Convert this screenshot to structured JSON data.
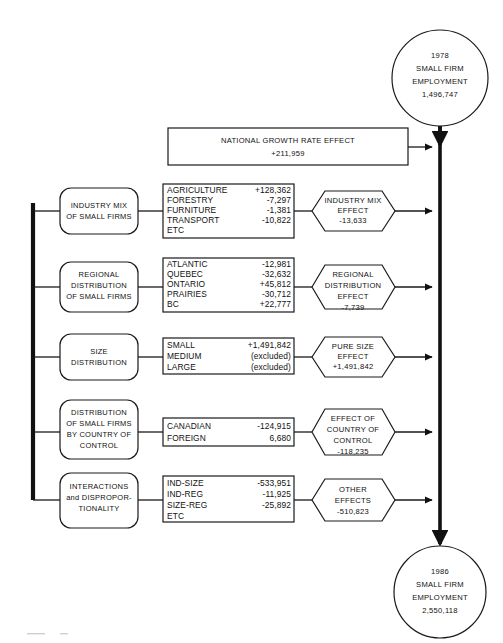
{
  "diagram": {
    "title_top": {
      "lines": [
        "1978",
        "SMALL FIRM",
        "EMPLOYMENT",
        "1,496,747"
      ],
      "year": "1978",
      "label_1": "SMALL FIRM",
      "label_2": "EMPLOYMENT",
      "value": "1,496,747"
    },
    "title_bottom": {
      "year": "1986",
      "label_1": "SMALL FIRM",
      "label_2": "EMPLOYMENT",
      "value": "2,550,118"
    },
    "national_growth": {
      "label": "NATIONAL GROWTH RATE EFFECT",
      "value": "+211,959"
    },
    "rows": [
      {
        "cause_lines": [
          "INDUSTRY MIX",
          "OF SMALL FIRMS"
        ],
        "items": [
          {
            "name": "AGRICULTURE",
            "value": "+128,362"
          },
          {
            "name": "FORESTRY",
            "value": "-7,297"
          },
          {
            "name": "FURNITURE",
            "value": "-1,381"
          },
          {
            "name": "TRANSPORT",
            "value": "-10,822"
          },
          {
            "name": "ETC",
            "value": ""
          }
        ],
        "effect_lines": [
          "INDUSTRY MIX",
          "EFFECT"
        ],
        "effect_value": "-13,633"
      },
      {
        "cause_lines": [
          "REGIONAL",
          "DISTRIBUTION",
          "OF SMALL FIRMS"
        ],
        "items": [
          {
            "name": "ATLANTIC",
            "value": "-12,981"
          },
          {
            "name": "QUEBEC",
            "value": "-32,632"
          },
          {
            "name": "ONTARIO",
            "value": "+45,812"
          },
          {
            "name": "PRAIRIES",
            "value": "-30,712"
          },
          {
            "name": "BC",
            "value": "+22,777"
          }
        ],
        "effect_lines": [
          "REGIONAL",
          "DISTRIBUTION",
          "EFFECT"
        ],
        "effect_value": "-7,739"
      },
      {
        "cause_lines": [
          "SIZE",
          "DISTRIBUTION"
        ],
        "items": [
          {
            "name": "SMALL",
            "value": "+1,491,842"
          },
          {
            "name": "MEDIUM",
            "value": "(excluded)"
          },
          {
            "name": "LARGE",
            "value": "(excluded)"
          }
        ],
        "effect_lines": [
          "PURE SIZE",
          "EFFECT"
        ],
        "effect_value": "+1,491,842"
      },
      {
        "cause_lines": [
          "DISTRIBUTION",
          "OF SMALL FIRMS",
          "BY COUNTRY OF",
          "CONTROL"
        ],
        "items": [
          {
            "name": "CANADIAN",
            "value": "-124,915"
          },
          {
            "name": "FOREIGN",
            "value": "6,680"
          }
        ],
        "effect_lines": [
          "EFFECT OF",
          "COUNTRY OF",
          "CONTROL"
        ],
        "effect_value": "-118,235"
      },
      {
        "cause_lines": [
          "INTERACTIONS",
          "and DISPROPOR-",
          "TIONALITY"
        ],
        "items": [
          {
            "name": "IND-SIZE",
            "value": "-533,951"
          },
          {
            "name": "IND-REG",
            "value": "-11,925"
          },
          {
            "name": "SIZE-REG",
            "value": "-25,892"
          },
          {
            "name": "ETC",
            "value": ""
          }
        ],
        "effect_lines": [
          "OTHER",
          "EFFECTS"
        ],
        "effect_value": "-510,823"
      }
    ],
    "colors": {
      "ink": "#111111",
      "paper": "#ffffff"
    }
  }
}
